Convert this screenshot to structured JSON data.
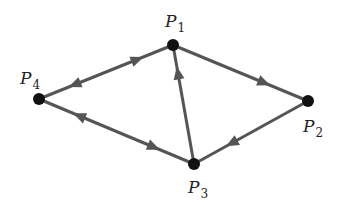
{
  "diagram": {
    "type": "directed-graph",
    "colors": {
      "edge": "#555555",
      "node": "#111111",
      "label": "#222222",
      "background": "#ffffff"
    },
    "nodes": [
      {
        "id": "P1",
        "base": "P",
        "sub": "1",
        "x": 173,
        "y": 45,
        "label_x": 165,
        "label_y": 27
      },
      {
        "id": "P2",
        "base": "P",
        "sub": "2",
        "x": 308,
        "y": 101,
        "label_x": 303,
        "label_y": 132
      },
      {
        "id": "P3",
        "base": "P",
        "sub": "3",
        "x": 194,
        "y": 164,
        "label_x": 188,
        "label_y": 193
      },
      {
        "id": "P4",
        "base": "P",
        "sub": "4",
        "x": 39,
        "y": 99,
        "label_x": 20,
        "label_y": 84
      }
    ],
    "edges": [
      {
        "from": "P4",
        "to": "P1",
        "bidirectional": true
      },
      {
        "from": "P1",
        "to": "P2",
        "bidirectional": false
      },
      {
        "from": "P2",
        "to": "P3",
        "bidirectional": false
      },
      {
        "from": "P3",
        "to": "P1",
        "bidirectional": false
      },
      {
        "from": "P4",
        "to": "P3",
        "bidirectional": true
      }
    ]
  }
}
